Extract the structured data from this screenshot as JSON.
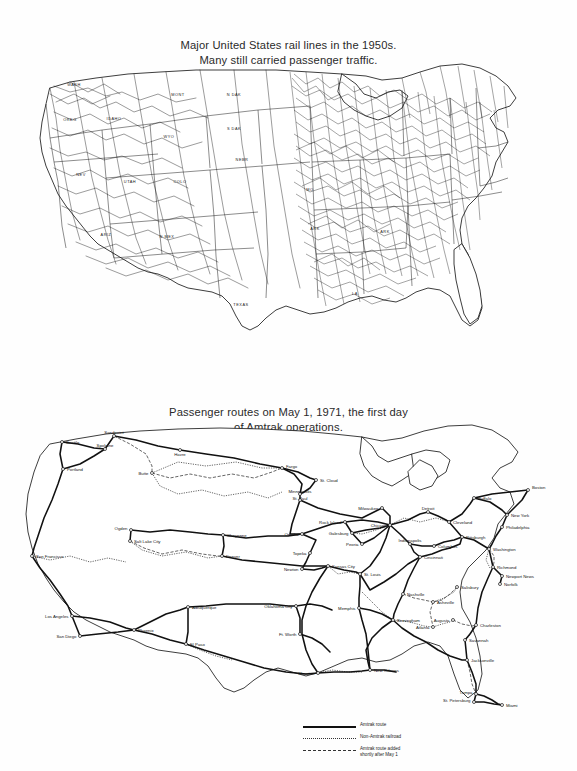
{
  "page": {
    "background_color": "#fefefe",
    "ink_color": "#111111"
  },
  "maps": [
    {
      "id": "rail-1950s",
      "title_line_1": "Major United States rail lines in the 1950s.",
      "title_line_2": "Many still carried passenger traffic.",
      "state_labels": [
        {
          "text": "WASH",
          "x": 64,
          "y": 28
        },
        {
          "text": "OREG",
          "x": 60,
          "y": 63
        },
        {
          "text": "IDAHO",
          "x": 104,
          "y": 62
        },
        {
          "text": "MONT",
          "x": 168,
          "y": 38
        },
        {
          "text": "N DAK",
          "x": 224,
          "y": 38
        },
        {
          "text": "S DAK",
          "x": 224,
          "y": 72
        },
        {
          "text": "WYO",
          "x": 159,
          "y": 80
        },
        {
          "text": "NEBR",
          "x": 232,
          "y": 103
        },
        {
          "text": "NEV",
          "x": 71,
          "y": 118
        },
        {
          "text": "UTAH",
          "x": 120,
          "y": 125
        },
        {
          "text": "COLO",
          "x": 170,
          "y": 125
        },
        {
          "text": "ARIZ",
          "x": 96,
          "y": 178
        },
        {
          "text": "N MEX",
          "x": 157,
          "y": 180
        },
        {
          "text": "MO",
          "x": 300,
          "y": 133
        },
        {
          "text": "ARK",
          "x": 305,
          "y": 172
        },
        {
          "text": "ARK",
          "x": 375,
          "y": 175
        },
        {
          "text": "TEXAS",
          "x": 231,
          "y": 248
        },
        {
          "text": "LA",
          "x": 345,
          "y": 237
        }
      ]
    },
    {
      "id": "amtrak-1971",
      "title_line_1": "Passenger routes on May 1, 1971, the first day",
      "title_line_2": "of Amtrak operations.",
      "cities": [
        {
          "name": "Seattle",
          "x": 52,
          "y": 20,
          "anchor": "start",
          "dx": 4,
          "dy": 1.6
        },
        {
          "name": "Sandpoint",
          "x": 104,
          "y": 14,
          "anchor": "middle",
          "dx": 0,
          "dy": -2.5
        },
        {
          "name": "Spokane",
          "x": 95,
          "y": 27,
          "anchor": "middle",
          "dx": 0,
          "dy": -2.5
        },
        {
          "name": "Portland",
          "x": 53,
          "y": 47,
          "anchor": "start",
          "dx": 4,
          "dy": 1.6
        },
        {
          "name": "Havre",
          "x": 170,
          "y": 28,
          "anchor": "middle",
          "dx": 0,
          "dy": 5.5
        },
        {
          "name": "Butte",
          "x": 142,
          "y": 51,
          "anchor": "end",
          "dx": -3.5,
          "dy": 1.6
        },
        {
          "name": "Fargo",
          "x": 272,
          "y": 46,
          "anchor": "start",
          "dx": 4,
          "dy": 0
        },
        {
          "name": "St. Cloud",
          "x": 306,
          "y": 58,
          "anchor": "start",
          "dx": 4,
          "dy": 1.6
        },
        {
          "name": "Minneapolis",
          "x": 290,
          "y": 72,
          "anchor": "middle",
          "dx": 0,
          "dy": -1
        },
        {
          "name": "St. Paul",
          "x": 290,
          "y": 78,
          "anchor": "middle",
          "dx": 0,
          "dy": 0
        },
        {
          "name": "Ogden",
          "x": 121,
          "y": 108,
          "anchor": "end",
          "dx": -3.5,
          "dy": 0
        },
        {
          "name": "Salt Lake City",
          "x": 120,
          "y": 119,
          "anchor": "start",
          "dx": 4,
          "dy": 1.6
        },
        {
          "name": "Cheyenne",
          "x": 213,
          "y": 113,
          "anchor": "start",
          "dx": 4,
          "dy": 1.6
        },
        {
          "name": "Denver",
          "x": 212,
          "y": 134,
          "anchor": "start",
          "dx": 4,
          "dy": 1.6
        },
        {
          "name": "Omaha",
          "x": 292,
          "y": 112,
          "anchor": "end",
          "dx": -3.5,
          "dy": 1.6
        },
        {
          "name": "Topeka",
          "x": 300,
          "y": 131,
          "anchor": "end",
          "dx": -3.5,
          "dy": 1.6
        },
        {
          "name": "Newton",
          "x": 292,
          "y": 147,
          "anchor": "end",
          "dx": -3.5,
          "dy": 1.6
        },
        {
          "name": "Kansas City",
          "x": 318,
          "y": 144,
          "anchor": "start",
          "dx": 4,
          "dy": 1.6
        },
        {
          "name": "St. Louis",
          "x": 350,
          "y": 152,
          "anchor": "start",
          "dx": 4,
          "dy": 1.6
        },
        {
          "name": "Rock Island",
          "x": 335,
          "y": 100,
          "anchor": "end",
          "dx": -3.5,
          "dy": 1.6
        },
        {
          "name": "Galesburg",
          "x": 342,
          "y": 111,
          "anchor": "end",
          "dx": -3.5,
          "dy": 1.6
        },
        {
          "name": "Peoria",
          "x": 352,
          "y": 122,
          "anchor": "end",
          "dx": -3.5,
          "dy": 1.6
        },
        {
          "name": "Milwaukee",
          "x": 372,
          "y": 86,
          "anchor": "end",
          "dx": -3.5,
          "dy": 1.6
        },
        {
          "name": "Chicago",
          "x": 380,
          "y": 103,
          "anchor": "end",
          "dx": -3.5,
          "dy": 1.6
        },
        {
          "name": "Detroit",
          "x": 418,
          "y": 90,
          "anchor": "middle",
          "dx": 0,
          "dy": -2.5
        },
        {
          "name": "Cleveland",
          "x": 439,
          "y": 100,
          "anchor": "start",
          "dx": 4,
          "dy": 1.6
        },
        {
          "name": "Buffalo",
          "x": 464,
          "y": 76,
          "anchor": "start",
          "dx": 4,
          "dy": 1.6
        },
        {
          "name": "Boston",
          "x": 518,
          "y": 68,
          "anchor": "start",
          "dx": 4,
          "dy": -1
        },
        {
          "name": "New York",
          "x": 497,
          "y": 93,
          "anchor": "start",
          "dx": 4,
          "dy": 1.6
        },
        {
          "name": "Philadelphia",
          "x": 492,
          "y": 105,
          "anchor": "start",
          "dx": 4,
          "dy": 1.6
        },
        {
          "name": "Pittsburgh",
          "x": 452,
          "y": 115,
          "anchor": "start",
          "dx": 4,
          "dy": 1.6
        },
        {
          "name": "Washington",
          "x": 479,
          "y": 127,
          "anchor": "start",
          "dx": 4,
          "dy": 1.6
        },
        {
          "name": "Indianapolis",
          "x": 400,
          "y": 122,
          "anchor": "middle",
          "dx": 0,
          "dy": -2.5
        },
        {
          "name": "Columbus",
          "x": 424,
          "y": 124,
          "anchor": "start",
          "dx": 4,
          "dy": 1.6
        },
        {
          "name": "Cincinnati",
          "x": 410,
          "y": 135,
          "anchor": "start",
          "dx": 4,
          "dy": 1.6
        },
        {
          "name": "Richmond",
          "x": 483,
          "y": 145,
          "anchor": "start",
          "dx": 4,
          "dy": 1.6
        },
        {
          "name": "Newport News",
          "x": 492,
          "y": 154,
          "anchor": "start",
          "dx": 4,
          "dy": 1.6
        },
        {
          "name": "Norfolk",
          "x": 490,
          "y": 162,
          "anchor": "start",
          "dx": 4,
          "dy": 1.6
        },
        {
          "name": "Salisbury",
          "x": 447,
          "y": 165,
          "anchor": "start",
          "dx": 4,
          "dy": 1.6
        },
        {
          "name": "Nashville",
          "x": 393,
          "y": 172,
          "anchor": "start",
          "dx": 4,
          "dy": 1.6
        },
        {
          "name": "Asheville",
          "x": 423,
          "y": 180,
          "anchor": "start",
          "dx": 4,
          "dy": 1.6
        },
        {
          "name": "Augusta",
          "x": 443,
          "y": 198,
          "anchor": "end",
          "dx": -3.5,
          "dy": 1.6
        },
        {
          "name": "Atlanta",
          "x": 423,
          "y": 205,
          "anchor": "end",
          "dx": -3.5,
          "dy": 1.6
        },
        {
          "name": "Birmingham",
          "x": 383,
          "y": 198,
          "anchor": "start",
          "dx": 4,
          "dy": 1.6
        },
        {
          "name": "Charleston",
          "x": 466,
          "y": 203,
          "anchor": "start",
          "dx": 4,
          "dy": 1.6
        },
        {
          "name": "Savannah",
          "x": 455,
          "y": 218,
          "anchor": "start",
          "dx": 4,
          "dy": 1.6
        },
        {
          "name": "Jacksonville",
          "x": 457,
          "y": 238,
          "anchor": "start",
          "dx": 4,
          "dy": 1.6
        },
        {
          "name": "Memphis",
          "x": 349,
          "y": 186,
          "anchor": "end",
          "dx": -3.5,
          "dy": 1.6
        },
        {
          "name": "New Orleans",
          "x": 360,
          "y": 248,
          "anchor": "start",
          "dx": 4,
          "dy": 1.6
        },
        {
          "name": "Houston",
          "x": 308,
          "y": 251,
          "anchor": "end",
          "dx": -3.5,
          "dy": 1.6
        },
        {
          "name": "Ft. Worth",
          "x": 290,
          "y": 212,
          "anchor": "end",
          "dx": -3.5,
          "dy": 1.6
        },
        {
          "name": "Oklahoma City",
          "x": 286,
          "y": 184,
          "anchor": "end",
          "dx": -3.5,
          "dy": 1.6
        },
        {
          "name": "Albuquerque",
          "x": 178,
          "y": 185,
          "anchor": "start",
          "dx": 4,
          "dy": 1.6
        },
        {
          "name": "El Paso",
          "x": 176,
          "y": 222,
          "anchor": "start",
          "dx": 4,
          "dy": 1.6
        },
        {
          "name": "Phoenix",
          "x": 124,
          "y": 208,
          "anchor": "start",
          "dx": 4,
          "dy": 1.6
        },
        {
          "name": "Los Angeles",
          "x": 62,
          "y": 194,
          "anchor": "end",
          "dx": -3.5,
          "dy": 1.6
        },
        {
          "name": "San Diego",
          "x": 70,
          "y": 214,
          "anchor": "end",
          "dx": -3.5,
          "dy": 1.6
        },
        {
          "name": "San Francisco",
          "x": 22,
          "y": 134,
          "anchor": "start",
          "dx": 4,
          "dy": 1.6
        },
        {
          "name": "Tampa",
          "x": 466,
          "y": 272,
          "anchor": "end",
          "dx": -3.5,
          "dy": 0
        },
        {
          "name": "St. Petersburg",
          "x": 464,
          "y": 280,
          "anchor": "end",
          "dx": -3.5,
          "dy": 0
        },
        {
          "name": "Miami",
          "x": 492,
          "y": 283,
          "anchor": "start",
          "dx": 4,
          "dy": 1.6
        }
      ]
    }
  ],
  "legend": {
    "items": [
      {
        "style": "solid",
        "label_line_1": "Amtrak route",
        "label_line_2": ""
      },
      {
        "style": "dotted",
        "label_line_1": "Non-Amtrak railroad",
        "label_line_2": ""
      },
      {
        "style": "dashed",
        "label_line_1": "Amtrak route added",
        "label_line_2": "shortly after May 1"
      }
    ]
  }
}
